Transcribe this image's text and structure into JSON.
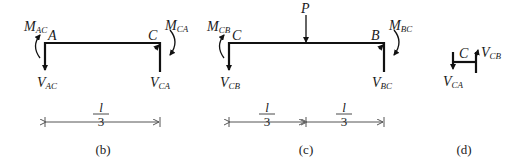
{
  "figure_b": {
    "caption": "(b)",
    "nodes": {
      "left": "A",
      "right": "C"
    },
    "moments": {
      "left": {
        "main": "M",
        "sub": "AC"
      },
      "right": {
        "main": "M",
        "sub": "CA"
      }
    },
    "shears": {
      "left": {
        "main": "V",
        "sub": "AC"
      },
      "right": {
        "main": "V",
        "sub": "CA"
      }
    },
    "span": {
      "numerator": "l",
      "denominator": "3"
    }
  },
  "figure_c": {
    "caption": "(c)",
    "nodes": {
      "left": "C",
      "right": "B"
    },
    "load": "P",
    "moments": {
      "left": {
        "main": "M",
        "sub": "CB"
      },
      "right": {
        "main": "M",
        "sub": "BC"
      }
    },
    "shears": {
      "left": {
        "main": "V",
        "sub": "CB"
      },
      "right": {
        "main": "V",
        "sub": "BC"
      }
    },
    "spans": [
      {
        "numerator": "l",
        "denominator": "3"
      },
      {
        "numerator": "l",
        "denominator": "3"
      }
    ]
  },
  "figure_d": {
    "caption": "(d)",
    "node": "C",
    "shears": {
      "left": {
        "main": "V",
        "sub": "CA"
      },
      "right": {
        "main": "V",
        "sub": "CB"
      }
    }
  }
}
